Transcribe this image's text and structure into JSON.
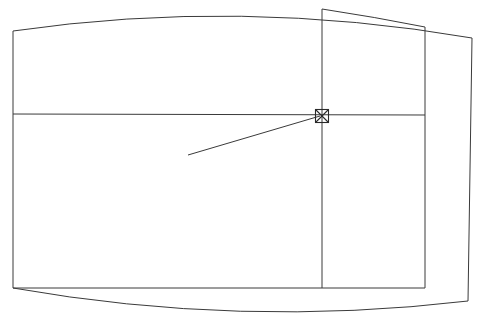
{
  "document": {
    "title": "Technical Line Drawing",
    "type": "line-diagram",
    "background_color": "#ffffff",
    "stroke_color": "#3a3a3a",
    "soft_stroke_color": "#6a6a6a",
    "width": 481,
    "height": 329
  },
  "geometry": {
    "outer_shell": {
      "name": "barrel-outline",
      "description": "Closed outline with bowed top edge, bowed bottom edge and straight left/right sides",
      "top_curve": "M 13,31 Q 240,-2 472,38",
      "bottom_curve": "M 13,288 Q 240,328 468,301",
      "left_side": "M 13,31 L 13,288",
      "right_side": "M 472,38 L 468,301"
    },
    "inner_panel": {
      "name": "right-inner-panel",
      "top_edge": "M 322,9 Q 375,17 425,27",
      "vertical_left": "M 322,9 L 322,288",
      "vertical_right": "M 425,27 L 425,288",
      "bottom_edge": "M 13,288 L 425,288"
    },
    "divider": {
      "name": "horizontal-divider",
      "path": "M 13,114 L 425,115"
    },
    "leader_line": {
      "name": "pointer-leader",
      "path": "M 188,155 L 320,116",
      "start_x": 188,
      "start_y": 155,
      "end_x": 320,
      "end_y": 116
    },
    "node_marker": {
      "name": "crosshair-node",
      "center_x": 322,
      "center_y": 116,
      "size": 13,
      "shape": "square-with-x"
    }
  },
  "labels": {
    "none_visible": ""
  }
}
